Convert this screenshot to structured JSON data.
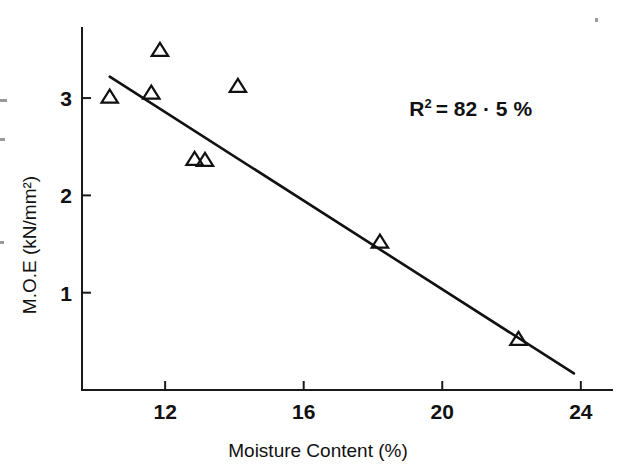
{
  "chart_data": {
    "type": "scatter",
    "title": "",
    "xlabel": "Moisture Content (%)",
    "ylabel": "M.O.E (kN/mm²)",
    "xlim": [
      9.6,
      24.9
    ],
    "ylim": [
      0.0,
      3.72
    ],
    "xticks": [
      12,
      16,
      20,
      24
    ],
    "yticks": [
      1,
      2,
      3
    ],
    "xtick_labels": [
      "12",
      "16",
      "20",
      "24"
    ],
    "ytick_labels": [
      "1",
      "2",
      "3"
    ],
    "grid": false,
    "legend": null,
    "marker": "open-triangle",
    "points": [
      {
        "x": 10.4,
        "y": 3.01
      },
      {
        "x": 11.6,
        "y": 3.05
      },
      {
        "x": 11.85,
        "y": 3.49
      },
      {
        "x": 12.85,
        "y": 2.37
      },
      {
        "x": 13.15,
        "y": 2.36
      },
      {
        "x": 14.1,
        "y": 3.12
      },
      {
        "x": 18.2,
        "y": 1.52
      },
      {
        "x": 22.2,
        "y": 0.52
      }
    ],
    "fit_line": {
      "x_start": 10.4,
      "y_start": 3.22,
      "x_end": 23.8,
      "y_end": 0.17,
      "slope": -0.2276,
      "intercept": 5.5874
    },
    "annotations": [
      {
        "name": "r-squared",
        "prefix": "R",
        "superscript": "2",
        "body": "= 82 · 5 %",
        "full_text": "R² = 82 · 5 %",
        "x": 19.05,
        "y": 2.82
      }
    ],
    "colors": {
      "axis": "#1a1a1a",
      "line": "#111111",
      "marker": "#111111",
      "background": "#ffffff"
    }
  }
}
